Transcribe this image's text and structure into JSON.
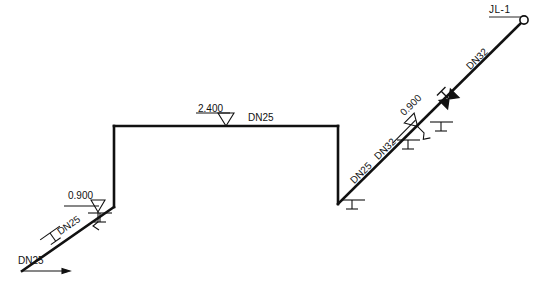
{
  "drawing": {
    "type": "piping-isometric-riser-diagram",
    "title": "",
    "line_color": "#111111",
    "background": "#ffffff",
    "canvas": {
      "width": 538,
      "height": 284
    }
  },
  "terminal": {
    "id_label": "JL-1",
    "marker": "open-circle",
    "x": 524,
    "y": 20
  },
  "pipe_route": {
    "description": "Riser diagram running from lower-left inlet up to JL-1 at upper right",
    "vertices": [
      {
        "name": "inlet-start",
        "x": 22,
        "y": 271
      },
      {
        "name": "left-slope-top",
        "x": 114,
        "y": 207
      },
      {
        "name": "left-riser-top",
        "x": 114,
        "y": 126
      },
      {
        "name": "mid-horizontal-right",
        "x": 338,
        "y": 126
      },
      {
        "name": "right-drop-bottom",
        "x": 338,
        "y": 204
      },
      {
        "name": "terminal-jl1",
        "x": 524,
        "y": 20
      }
    ]
  },
  "elevation_markers": [
    {
      "name": "elev-left",
      "value": "0.900",
      "x": 68,
      "y": 198,
      "rotation": 0,
      "symbol": "level-triangle"
    },
    {
      "name": "elev-middle",
      "value": "2.400",
      "x": 198,
      "y": 110,
      "rotation": 0,
      "symbol": "level-triangle"
    },
    {
      "name": "elev-right",
      "value": "0.900",
      "x": 400,
      "y": 118,
      "rotation": -45,
      "symbol": "level-triangle"
    }
  ],
  "pipe_size_labels": [
    {
      "name": "dn-inlet",
      "value": "DN25",
      "x": 18,
      "y": 262,
      "rotation": 0
    },
    {
      "name": "dn-left-slope",
      "value": "DN25",
      "x": 52,
      "y": 232,
      "rotation": -35
    },
    {
      "name": "dn-horizontal",
      "value": "DN25",
      "x": 248,
      "y": 118,
      "rotation": 0
    },
    {
      "name": "dn-right-lower",
      "value": "DN25",
      "x": 350,
      "y": 176,
      "rotation": -45
    },
    {
      "name": "dn-right-mid",
      "value": "DN32",
      "x": 374,
      "y": 152,
      "rotation": -45
    },
    {
      "name": "dn-right-upper",
      "value": "DN32",
      "x": 466,
      "y": 62,
      "rotation": -45
    }
  ],
  "fittings": [
    {
      "name": "valve-right-diagonal",
      "type": "gate-valve",
      "x": 449,
      "y": 99,
      "rotation": -45
    }
  ],
  "supports": [
    {
      "name": "support-left-slope",
      "x": 50,
      "y": 233,
      "rotation": -35
    },
    {
      "name": "support-left-riser",
      "x": 100,
      "y": 213,
      "rotation": 0
    },
    {
      "name": "support-right-base",
      "x": 352,
      "y": 200,
      "rotation": 0
    },
    {
      "name": "support-right-mid",
      "x": 408,
      "y": 140,
      "rotation": 0
    },
    {
      "name": "support-right-upper",
      "x": 441,
      "y": 122,
      "rotation": 0
    }
  ],
  "flow_arrow": {
    "name": "inlet-flow-arrow",
    "from_x": 22,
    "from_y": 271,
    "to_x": 72,
    "to_y": 271
  }
}
